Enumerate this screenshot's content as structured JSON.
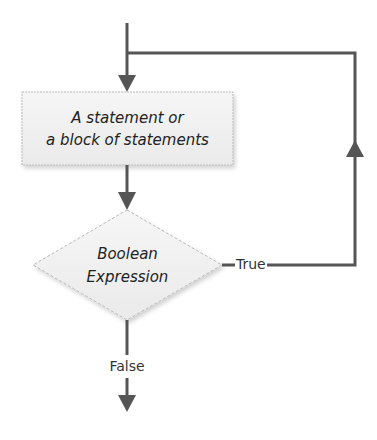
{
  "diagram": {
    "type": "flowchart",
    "nodes": {
      "statement": {
        "shape": "rectangle",
        "line1": "A statement or",
        "line2": "a block of statements"
      },
      "condition": {
        "shape": "diamond",
        "line1": "Boolean",
        "line2": "Expression"
      }
    },
    "edges": {
      "true_label": "True",
      "false_label": "False"
    },
    "colors": {
      "line": "#555555",
      "box_fill": "#f2f2f2",
      "box_border": "#b8b8b8",
      "text": "#222222"
    }
  }
}
